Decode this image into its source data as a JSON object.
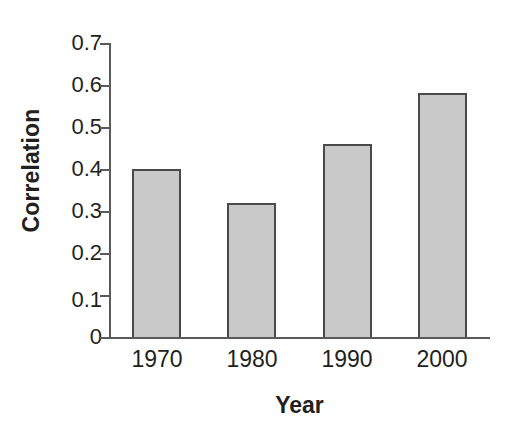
{
  "chart_data": {
    "type": "bar",
    "title": "",
    "categories": [
      "1970",
      "1980",
      "1990",
      "2000"
    ],
    "values": [
      0.4,
      0.32,
      0.46,
      0.58
    ],
    "series": [
      {
        "name": "Correlation",
        "values": [
          0.4,
          0.32,
          0.46,
          0.58
        ]
      }
    ],
    "xlabel": "Year",
    "ylabel": "Correlation",
    "ylim": [
      0,
      0.7
    ],
    "ytick_labels": [
      "0.7",
      "0.6",
      "0.5",
      "0.4",
      "0.3",
      "0.2",
      "0.1",
      "0"
    ],
    "ytick_values": [
      0.7,
      0.6,
      0.5,
      0.4,
      0.3,
      0.2,
      0.1,
      0
    ],
    "xtick_labels": [
      "1970",
      "1980",
      "1990",
      "2000"
    ],
    "grid": false,
    "legend": null,
    "bar_fill_color": "#c9c9c9",
    "bar_edge_color": "#4a4a4a",
    "axis_color": "#5a5a5a",
    "text_color": "#231f20",
    "background_color": "#ffffff"
  }
}
